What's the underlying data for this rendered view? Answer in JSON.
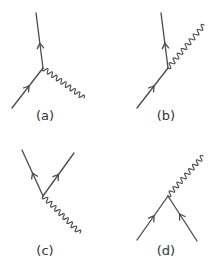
{
  "figure": {
    "width": 215,
    "height": 266,
    "line_color": "#4a4a4a",
    "label_color": "#333333",
    "stroke_width": 1.3
  },
  "diagrams": [
    {
      "id": "a",
      "label": "(a)",
      "label_pos": [
        45,
        116
      ],
      "vertex": [
        43,
        68
      ],
      "fermions": [
        {
          "from": [
            12,
            108
          ],
          "to": [
            43,
            68
          ],
          "arrow_at": 0.55
        },
        {
          "from": [
            43,
            68
          ],
          "to": [
            36,
            13
          ],
          "arrow_at": 0.45
        }
      ],
      "photon": {
        "from": [
          43,
          68
        ],
        "to": [
          84,
          98
        ],
        "waves": 9
      }
    },
    {
      "id": "b",
      "label": "(b)",
      "label_pos": [
        166,
        116
      ],
      "vertex": [
        168,
        68
      ],
      "fermions": [
        {
          "from": [
            137,
            108
          ],
          "to": [
            168,
            68
          ],
          "arrow_at": 0.55
        },
        {
          "from": [
            168,
            68
          ],
          "to": [
            161,
            13
          ],
          "arrow_at": 0.45
        }
      ],
      "photon": {
        "from": [
          168,
          68
        ],
        "to": [
          204,
          25
        ],
        "waves": 9
      }
    },
    {
      "id": "c",
      "label": "(c)",
      "label_pos": [
        45,
        251
      ],
      "vertex": [
        43,
        196
      ],
      "fermions": [
        {
          "from": [
            43,
            196
          ],
          "to": [
            22,
            150
          ],
          "arrow_at": 0.5
        },
        {
          "from": [
            43,
            196
          ],
          "to": [
            74,
            153
          ],
          "arrow_at": 0.5
        }
      ],
      "photon": {
        "from": [
          43,
          196
        ],
        "to": [
          80,
          233
        ],
        "waves": 9
      }
    },
    {
      "id": "d",
      "label": "(d)",
      "label_pos": [
        166,
        251
      ],
      "vertex": [
        168,
        196
      ],
      "fermions": [
        {
          "from": [
            137,
            240
          ],
          "to": [
            168,
            196
          ],
          "arrow_at": 0.55
        },
        {
          "from": [
            197,
            241
          ],
          "to": [
            168,
            196
          ],
          "arrow_at": 0.6
        }
      ],
      "photon": {
        "from": [
          168,
          196
        ],
        "to": [
          203,
          156
        ],
        "waves": 9
      }
    }
  ]
}
